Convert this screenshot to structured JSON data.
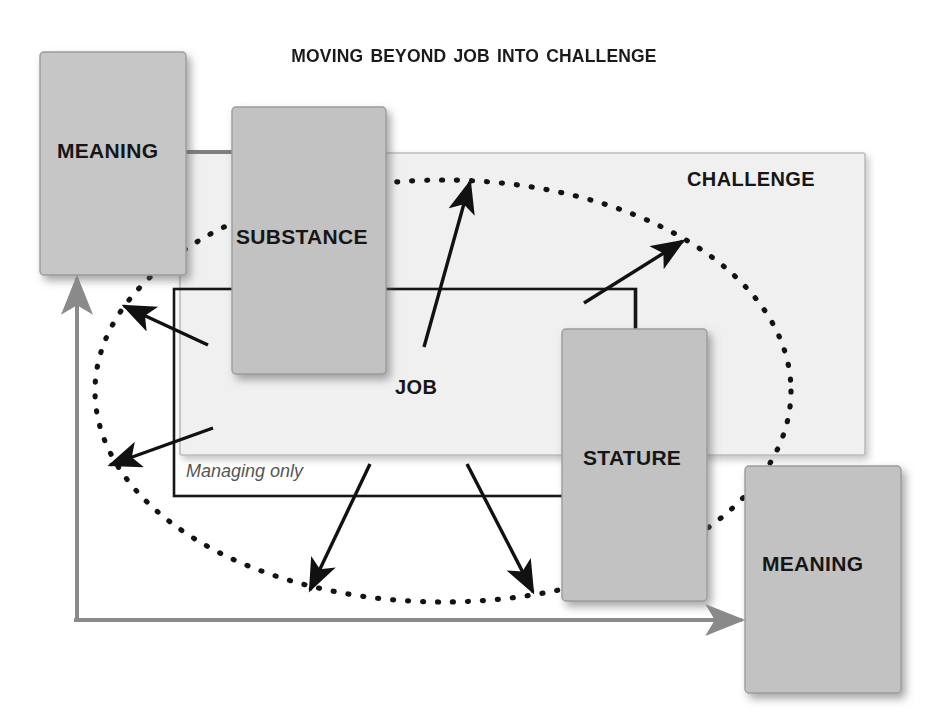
{
  "title": "Moving Beyond Job into Challenge",
  "diagram": {
    "type": "concept-diagram",
    "boxes": [
      {
        "id": "meaning-top",
        "label": "MEANING",
        "x": 40,
        "y": 52,
        "w": 146,
        "h": 223,
        "fill": "#c6c6c6"
      },
      {
        "id": "substance",
        "label": "SUBSTANCE",
        "x": 232,
        "y": 107,
        "w": 154,
        "h": 267,
        "fill": "#c2c2c2"
      },
      {
        "id": "stature",
        "label": "STATURE",
        "x": 562,
        "y": 329,
        "w": 145,
        "h": 272,
        "fill": "#c2c2c2"
      },
      {
        "id": "meaning-bot",
        "label": "MEANING",
        "x": 745,
        "y": 466,
        "w": 156,
        "h": 227,
        "fill": "#c2c2c2"
      }
    ],
    "regions": [
      {
        "id": "challenge",
        "label": "CHALLENGE",
        "shape": "rectangle",
        "x": 180,
        "y": 153,
        "w": 685,
        "h": 302,
        "fill": "#f0f0f0"
      },
      {
        "id": "job",
        "label": "JOB",
        "shape": "rectangle",
        "x": 174,
        "y": 289,
        "w": 462,
        "h": 207,
        "fill": "none"
      },
      {
        "id": "ellipse",
        "label": "",
        "shape": "dotted-ellipse",
        "cx": 443,
        "cy": 391,
        "rx": 348,
        "ry": 211
      }
    ],
    "notes": [
      {
        "id": "managing-only",
        "label": "Managing only",
        "style": "italic"
      }
    ],
    "arrows": [
      {
        "id": "arrow-substance-outleft-upper",
        "from": [
          208,
          345
        ],
        "to": [
          122,
          305
        ],
        "color": "#111111"
      },
      {
        "id": "arrow-job-outleft-lower",
        "from": [
          213,
          428
        ],
        "to": [
          108,
          466
        ],
        "color": "#111111"
      },
      {
        "id": "arrow-job-outtop",
        "from": [
          424,
          347
        ],
        "to": [
          470,
          180
        ],
        "color": "#111111"
      },
      {
        "id": "arrow-job-outtopright",
        "from": [
          584,
          303
        ],
        "to": [
          685,
          240
        ],
        "color": "#111111"
      },
      {
        "id": "arrow-job-outbottomleft",
        "from": [
          370,
          465
        ],
        "to": [
          309,
          592
        ],
        "color": "#111111"
      },
      {
        "id": "arrow-job-outbottomright",
        "from": [
          467,
          465
        ],
        "to": [
          534,
          594
        ],
        "color": "#111111"
      },
      {
        "id": "arrow-loop-left-up",
        "from": [
          77,
          620
        ],
        "to": [
          77,
          272
        ],
        "color": "#8a8a8a"
      },
      {
        "id": "arrow-loop-bottom-right",
        "from": [
          77,
          620
        ],
        "to": [
          748,
          620
        ],
        "color": "#8a8a8a"
      }
    ],
    "connectors": [
      {
        "id": "connector-meaning-substance",
        "from": [
          186,
          152
        ],
        "to": [
          232,
          152
        ]
      },
      {
        "id": "connector-stature-jobtop",
        "from": [
          635,
          289
        ],
        "to": [
          635,
          332
        ]
      }
    ],
    "colors": {
      "box_fill": "#c2c2c2",
      "box_border": "#9a9a9a",
      "region_fill": "#f0f0f0",
      "region_border": "#b9b9b9",
      "line_black": "#111111",
      "line_gray": "#8a8a8a",
      "text": "#161616",
      "note_text": "#555555",
      "background": "#ffffff"
    }
  }
}
